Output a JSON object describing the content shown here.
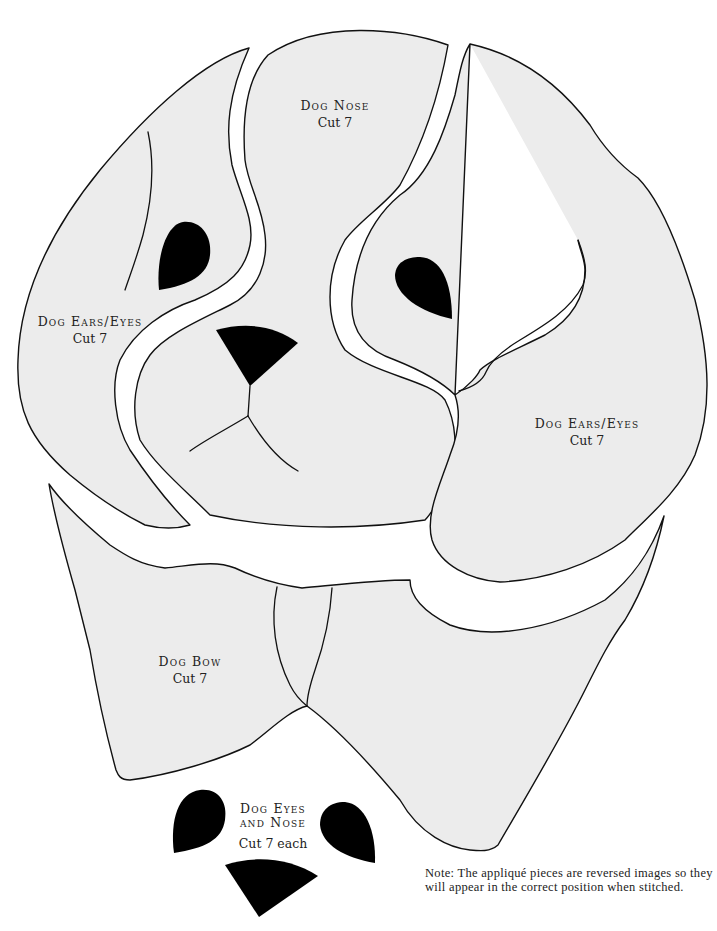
{
  "pattern": {
    "colors": {
      "piece_fill": "#ececec",
      "outline": "#111111",
      "solid": "#000000",
      "background": "#ffffff"
    },
    "pieces": [
      {
        "id": "dog-nose",
        "title": "Dog Nose",
        "cut": "Cut 7"
      },
      {
        "id": "dog-ears-eyes-left",
        "title": "Dog Ears/Eyes",
        "cut": "Cut 7"
      },
      {
        "id": "dog-ears-eyes-right",
        "title": "Dog Ears/Eyes",
        "cut": "Cut 7"
      },
      {
        "id": "dog-bow",
        "title": "Dog Bow",
        "cut": "Cut 7"
      },
      {
        "id": "dog-eyes-and-nose",
        "title_line1": "Dog Eyes",
        "title_line2": "and Nose",
        "cut": "Cut 7 each"
      }
    ],
    "note": "Note: The appliqué pieces are reversed images so they will appear in the correct position when stitched."
  }
}
